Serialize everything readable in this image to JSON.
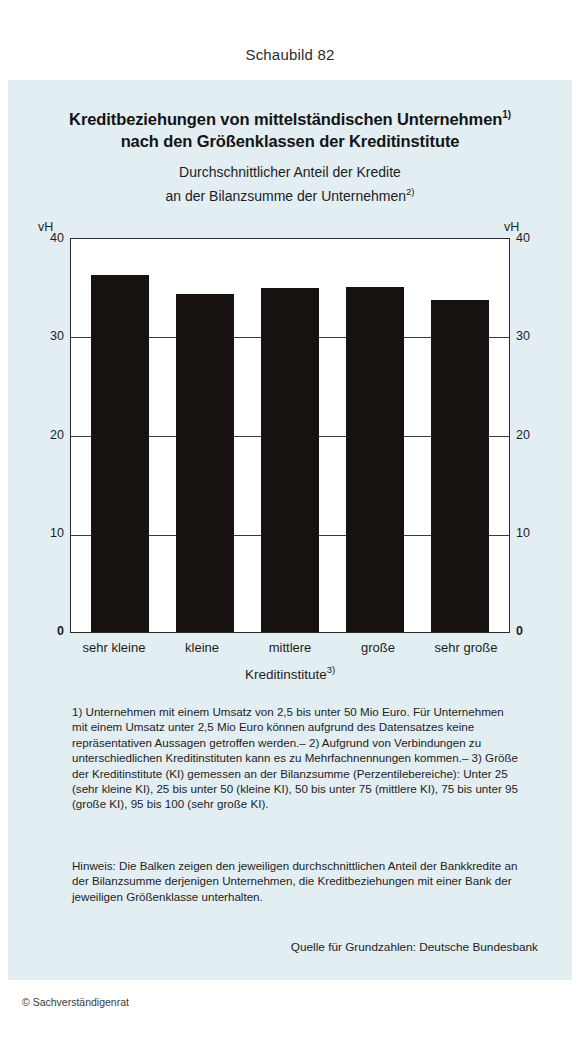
{
  "figure": {
    "number_label": "Schaubild 82"
  },
  "titles": {
    "main_line1": "Kreditbeziehungen von mittelständischen Unternehmen",
    "main_line1_sup": "1)",
    "main_line2": "nach den Größenklassen der Kreditinstitute",
    "sub_line1": "Durchschnittlicher Anteil der Kredite",
    "sub_line2": "an der Bilanzsumme der Unternehmen",
    "sub_line2_sup": "2)"
  },
  "axes": {
    "unit_left": "vH",
    "unit_right": "vH",
    "yticks": [
      "40",
      "30",
      "20",
      "10",
      "0"
    ],
    "xaxis_title": "Kreditinstitute",
    "xaxis_title_sup": "3)"
  },
  "chart_data": {
    "type": "bar",
    "subtitle": "Durchschnittlicher Anteil der Kredite an der Bilanzsumme der Unternehmen",
    "categories": [
      "sehr kleine",
      "kleine",
      "mittlere",
      "große",
      "sehr große"
    ],
    "values": [
      36.3,
      34.4,
      35.0,
      35.1,
      33.8
    ],
    "xlabel": "Kreditinstitute",
    "ylabel": "vH",
    "ylim": [
      0,
      40
    ],
    "yticks": [
      0,
      10,
      20,
      30,
      40
    ],
    "grid": true,
    "legend": "none",
    "bar_color": "#171210"
  },
  "footnotes": {
    "text": "1) Unternehmen mit einem Umsatz von 2,5 bis unter 50 Mio Euro. Für Unternehmen mit einem Umsatz unter 2,5 Mio Euro können aufgrund des Datensatzes keine repräsentativen Aussagen getroffen werden.– 2) Aufgrund von Verbindungen zu unterschiedlichen Kreditinstituten kann es zu Mehrfachnennungen kommen.– 3) Größe der Kreditinstitute (KI) gemessen an der Bilanzsumme (Perzentilebereiche): Unter 25 (sehr kleine KI), 25 bis unter 50 (kleine KI), 50 bis unter 75 (mittlere KI), 75 bis unter 95 (große KI), 95 bis 100 (sehr große KI)."
  },
  "note": {
    "text": "Hinweis: Die Balken zeigen den jeweiligen durchschnittlichen Anteil der Bankkredite an der Bilanzsumme derjenigen Unternehmen, die Kreditbeziehungen mit einer Bank der jeweiligen Größenklasse unterhalten."
  },
  "source": {
    "text": "Quelle für Grundzahlen: Deutsche Bundesbank"
  },
  "copyright": {
    "text": "© Sachverständigenrat"
  }
}
